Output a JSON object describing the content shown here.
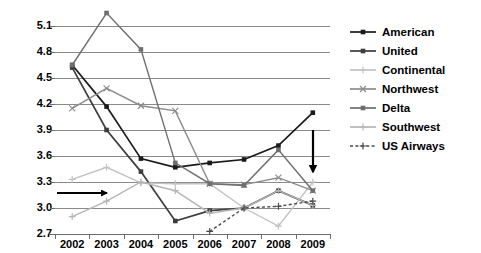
{
  "chart_data": {
    "type": "line",
    "title": "",
    "xlabel": "",
    "ylabel": "",
    "categories": [
      "2002",
      "2003",
      "2004",
      "2005",
      "2006",
      "2007",
      "2008",
      "2009"
    ],
    "ylim": [
      2.7,
      5.1
    ],
    "yticks": [
      "2.7",
      "3.0",
      "3.3",
      "3.6",
      "3.9",
      "4.2",
      "4.5",
      "4.8",
      "5.1"
    ],
    "ytick_values": [
      2.7,
      3.0,
      3.3,
      3.6,
      3.9,
      4.2,
      4.5,
      4.8,
      5.1
    ],
    "grid": true,
    "legend_position": "right",
    "series": [
      {
        "name": "American",
        "color": "#1a1a1a",
        "marker": "square",
        "dash": "solid",
        "values": [
          4.65,
          4.17,
          3.57,
          3.47,
          3.52,
          3.56,
          3.72,
          4.1
        ]
      },
      {
        "name": "United",
        "color": "#3d3d3d",
        "marker": "square",
        "dash": "solid",
        "values": [
          4.62,
          3.9,
          3.42,
          2.85,
          2.97,
          3.0,
          3.2,
          3.03
        ]
      },
      {
        "name": "Continental",
        "color": "#c2c2c2",
        "marker": "plus",
        "dash": "solid",
        "values": [
          3.33,
          3.47,
          3.29,
          3.28,
          3.28,
          3.0,
          2.79,
          3.3
        ]
      },
      {
        "name": "Northwest",
        "color": "#8c8c8c",
        "marker": "cross",
        "dash": "solid",
        "values": [
          4.15,
          4.38,
          4.18,
          4.12,
          3.28,
          3.27,
          3.35,
          3.2
        ]
      },
      {
        "name": "Delta",
        "color": "#6e6e6e",
        "marker": "square",
        "dash": "solid",
        "values": [
          4.65,
          5.25,
          4.83,
          3.52,
          3.28,
          3.26,
          3.67,
          3.2
        ]
      },
      {
        "name": "Southwest",
        "color": "#b5b5b5",
        "marker": "plus",
        "dash": "solid",
        "values": [
          2.9,
          3.08,
          3.3,
          3.2,
          2.94,
          3.0,
          3.2,
          3.03
        ]
      },
      {
        "name": "US Airways",
        "color": "#4a4a4a",
        "marker": "plus",
        "dash": "dashed",
        "values": [
          null,
          null,
          null,
          null,
          2.73,
          3.0,
          3.02,
          3.08
        ]
      }
    ],
    "annotations": [
      {
        "name": "horizontal-arrow",
        "direction": "right",
        "from_x": 57,
        "from_y": 193,
        "to_x": 107,
        "to_y": 193
      },
      {
        "name": "vertical-arrow",
        "direction": "down",
        "from_x": 313,
        "from_y": 130,
        "to_x": 313,
        "to_y": 172
      }
    ]
  },
  "legend": {
    "items": [
      {
        "label": "American"
      },
      {
        "label": "United"
      },
      {
        "label": "Continental"
      },
      {
        "label": "Northwest"
      },
      {
        "label": "Delta"
      },
      {
        "label": "Southwest"
      },
      {
        "label": "US Airways"
      }
    ]
  }
}
